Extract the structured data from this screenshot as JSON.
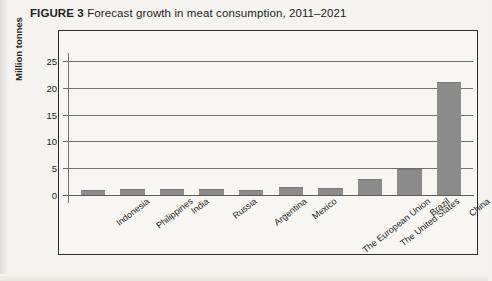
{
  "figure": {
    "label": "FIGURE",
    "number": "3",
    "title": "Forecast growth in meat consumption, 2011–2021",
    "full_title": "FIGURE 3 Forecast growth in meat consumption, 2011–2021"
  },
  "colors": {
    "bar": "#8b8b8b",
    "frame": "#2b2b2b",
    "gridline": "#6f6f6f",
    "background": "#f4f3ef",
    "text": "#1d1d1d"
  },
  "chart_data": {
    "type": "bar",
    "title": "Forecast growth in meat consumption, 2011–2021",
    "xlabel": "",
    "ylabel": "Million tonnes",
    "ylim": [
      0,
      27
    ],
    "yticks": [
      0,
      5,
      10,
      15,
      20,
      25
    ],
    "ytick_labels": [
      "0",
      "5",
      "10",
      "15",
      "20",
      "25"
    ],
    "grid": true,
    "legend": false,
    "categories": [
      "Indonesia",
      "Philippines",
      "India",
      "Russia",
      "Argentina",
      "Mexico",
      "The European Union",
      "The United States",
      "Brazil",
      "China"
    ],
    "values": [
      0.9,
      1.1,
      1.2,
      1.1,
      1.0,
      1.5,
      1.3,
      2.9,
      4.9,
      21.0
    ],
    "series": [
      {
        "name": "Forecast growth 2011–2021",
        "values": [
          0.9,
          1.1,
          1.2,
          1.1,
          1.0,
          1.5,
          1.3,
          2.9,
          4.9,
          21.0
        ]
      }
    ]
  }
}
